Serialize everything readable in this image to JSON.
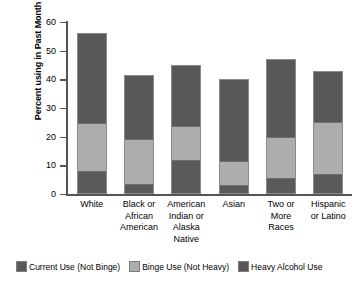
{
  "chart_data": {
    "type": "bar",
    "subtype": "stacked-bar",
    "title": "",
    "xlabel": "",
    "ylabel": "Percent using in Past Month",
    "ylim": [
      0,
      60
    ],
    "yticks": [
      0,
      10,
      20,
      30,
      40,
      50,
      60
    ],
    "ytick_labels": [
      "0",
      "10",
      "20",
      "30",
      "40",
      "50",
      "60"
    ],
    "grid": false,
    "legend_position": "bottom",
    "categories": [
      "White",
      "Black or\nAfrican\nAmerican",
      "American\nIndian or\nAlaska\nNative",
      "Asian",
      "Two or\nMore\nRaces",
      "Hispanic\nor Latino"
    ],
    "series": [
      {
        "name": "Current Use (Not Binge)",
        "color": "#5a5a5a",
        "values": [
          7.5,
          3.0,
          11.5,
          2.5,
          5.0,
          6.5
        ]
      },
      {
        "name": "Binge Use (Not Heavy)",
        "color": "#adadad",
        "values": [
          17.0,
          15.8,
          12.0,
          8.5,
          14.5,
          18.5
        ]
      },
      {
        "name": "Heavy Alcohol Use",
        "color": "#585858",
        "values": [
          31.5,
          22.7,
          21.5,
          29.0,
          27.5,
          18.0
        ]
      }
    ],
    "cumulative_tops": [
      56.0,
      41.5,
      45.0,
      40.0,
      47.0,
      43.0
    ]
  },
  "legend": {
    "items": [
      {
        "label": "Current Use (Not Binge)",
        "color": "#5a5a5a"
      },
      {
        "label": "Binge Use (Not Heavy)",
        "color": "#adadad"
      },
      {
        "label": "Heavy Alcohol Use",
        "color": "#585858"
      }
    ]
  }
}
